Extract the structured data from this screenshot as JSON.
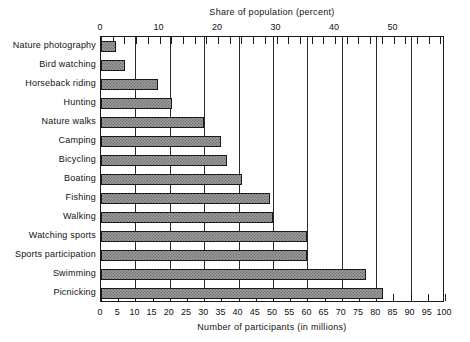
{
  "chart_data": {
    "type": "bar",
    "orientation": "horizontal",
    "title": "",
    "xlabel": "Number of participants (in millions)",
    "xlabel_top": "Share of population (percent)",
    "ylabel": "",
    "categories": [
      "Nature photography",
      "Bird watching",
      "Horseback riding",
      "Hunting",
      "Nature walks",
      "Camping",
      "Bicycling",
      "Boating",
      "Fishing",
      "Walking",
      "Watching sports",
      "Sports participation",
      "Swimming",
      "Picnicking"
    ],
    "values": [
      4.5,
      7,
      16.5,
      20.5,
      30,
      35,
      36.5,
      41,
      49,
      50,
      60,
      60,
      77,
      82
    ],
    "xlim": [
      0,
      100
    ],
    "xticks": [
      0,
      5,
      10,
      15,
      20,
      25,
      30,
      35,
      40,
      45,
      50,
      55,
      60,
      65,
      70,
      75,
      80,
      85,
      90,
      95,
      100
    ],
    "xticklabels": [
      "0",
      "5",
      "10",
      "15",
      "20",
      "25",
      "30",
      "35",
      "40",
      "45",
      "50",
      "55",
      "60",
      "65",
      "70",
      "75",
      "80",
      "85",
      "90",
      "95",
      "100"
    ],
    "top_axis": {
      "label": "Share of population (percent)",
      "lim": [
        0,
        58.8
      ],
      "ticks": [
        0,
        10,
        20,
        30,
        40,
        50
      ],
      "ticklabels": [
        "0",
        "10",
        "20",
        "30",
        "40",
        "50"
      ],
      "minor_tick_step": 2
    },
    "gridlines": {
      "enabled": true,
      "at": [
        10,
        20,
        30,
        40,
        50,
        60,
        70,
        80,
        90
      ],
      "axis": "x"
    },
    "legend": {
      "visible": false
    },
    "bar_fill_color": "#9e9e9e",
    "bar_edge_color": "#1a1a1a",
    "bar_pattern": "checkerboard-dither",
    "frame_color": "#1a1a1a",
    "background_color": "#ffffff"
  }
}
